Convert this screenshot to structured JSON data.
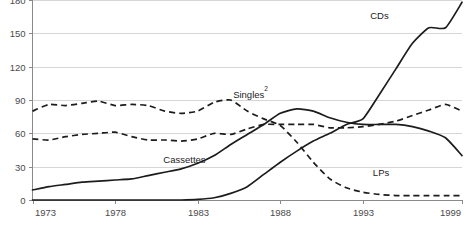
{
  "chart_data": {
    "type": "line",
    "title": "",
    "subtitle": "",
    "xlabel": "",
    "ylabel": "",
    "xlim": [
      1973,
      1999
    ],
    "ylim": [
      0,
      180
    ],
    "grid": true,
    "legend_position": "inline-annotations",
    "yticks": [
      0,
      30,
      60,
      90,
      120,
      150,
      180
    ],
    "ytick_labels": [
      "0",
      "30",
      "60",
      "90",
      "120",
      "150",
      "180"
    ],
    "xticks": [
      1973,
      1978,
      1983,
      1988,
      1993,
      1999
    ],
    "xtick_labels": [
      "1973",
      "1978",
      "1983",
      "1988",
      "1993",
      "1999"
    ],
    "x": [
      1973,
      1974,
      1975,
      1976,
      1977,
      1978,
      1979,
      1980,
      1981,
      1982,
      1983,
      1984,
      1985,
      1986,
      1987,
      1988,
      1989,
      1990,
      1991,
      1992,
      1993,
      1994,
      1995,
      1996,
      1997,
      1998,
      1999
    ],
    "series": [
      {
        "name": "LPs",
        "style": "dashed",
        "label": "LPs",
        "label_x": 1994.1,
        "label_y": 22,
        "values": [
          80,
          86,
          85,
          87,
          89,
          85,
          86,
          85,
          80,
          78,
          80,
          88,
          90,
          80,
          73,
          67,
          52,
          34,
          19,
          11,
          7,
          5,
          4,
          4,
          4,
          4,
          4
        ]
      },
      {
        "name": "Singles2",
        "style": "dashed",
        "label": "Singles",
        "label_superscript": "2",
        "label_x": 1986.2,
        "label_y": 92,
        "values": [
          55,
          54,
          57,
          59,
          60,
          61,
          57,
          54,
          54,
          53,
          55,
          60,
          59,
          64,
          68,
          68,
          68,
          68,
          65,
          65,
          66,
          68,
          71,
          76,
          81,
          86,
          80
        ]
      },
      {
        "name": "Cassettes",
        "style": "solid",
        "label": "Cassettes",
        "label_x": 1982.2,
        "label_y": 33,
        "values": [
          9,
          12,
          14,
          16,
          17,
          18,
          19,
          22,
          25,
          28,
          33,
          40,
          50,
          59,
          68,
          78,
          82,
          80,
          74,
          70,
          68,
          68,
          68,
          66,
          62,
          56,
          40
        ]
      },
      {
        "name": "CDs",
        "style": "solid",
        "label": "CDs",
        "label_x": 1994.0,
        "label_y": 163,
        "values": [
          0,
          0,
          0,
          0,
          0,
          0,
          0,
          0,
          0,
          0,
          0.5,
          2,
          6,
          12,
          23,
          34,
          44,
          53,
          60,
          68,
          73,
          95,
          118,
          141,
          155,
          155,
          178
        ]
      }
    ]
  },
  "axis": {
    "y_axis_name": "value-axis",
    "x_axis_name": "year-axis"
  }
}
